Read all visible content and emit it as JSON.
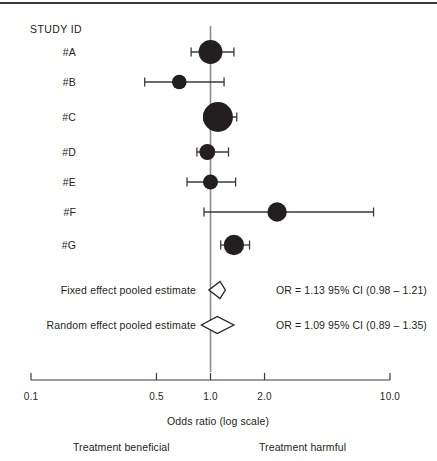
{
  "figure": {
    "type": "forest-plot",
    "header_label": "STUDY ID",
    "axis_title": "Odds ratio (log scale)",
    "footnote_left": "Treatment beneficial",
    "footnote_right": "Treatment harmful",
    "marker_color": "#231f20",
    "line_color": "#3a3a3a",
    "ref_line_color": "#8a8a8a"
  },
  "chart_data": {
    "type": "scatter",
    "title": "",
    "xlabel": "Odds ratio (log scale)",
    "ylabel": "",
    "scale": "log",
    "xlim": [
      0.1,
      10.0
    ],
    "tick_values": [
      0.1,
      0.5,
      1.0,
      2.0,
      10.0
    ],
    "tick_labels": [
      "0.1",
      "0.5",
      "1.0",
      "2.0",
      "10.0"
    ],
    "grid": false,
    "legend": "none",
    "reference_line": 1.0,
    "rows": [
      {
        "label": "#A",
        "or": 1.0,
        "ci_low": 0.78,
        "ci_high": 1.35,
        "weight": 0.72,
        "kind": "study"
      },
      {
        "label": "#B",
        "or": 0.67,
        "ci_low": 0.43,
        "ci_high": 1.19,
        "weight": 0.3,
        "kind": "study"
      },
      {
        "label": "#C",
        "or": 1.1,
        "ci_low": 0.92,
        "ci_high": 1.4,
        "weight": 1.0,
        "kind": "study"
      },
      {
        "label": "#D",
        "or": 0.96,
        "ci_low": 0.84,
        "ci_high": 1.26,
        "weight": 0.36,
        "kind": "study"
      },
      {
        "label": "#E",
        "or": 1.0,
        "ci_low": 0.74,
        "ci_high": 1.38,
        "weight": 0.32,
        "kind": "study"
      },
      {
        "label": "#F",
        "or": 2.35,
        "ci_low": 0.92,
        "ci_high": 8.1,
        "weight": 0.52,
        "kind": "study"
      },
      {
        "label": "#G",
        "or": 1.35,
        "ci_low": 1.14,
        "ci_high": 1.65,
        "weight": 0.56,
        "kind": "study"
      }
    ],
    "pooled": [
      {
        "label": "Fixed effect pooled estimate",
        "or": 1.13,
        "ci_low": 0.98,
        "ci_high": 1.21,
        "kind": "diamond",
        "annotation": "OR = 1.13 95% CI (0.98 – 1.21)"
      },
      {
        "label": "Random effect pooled estimate",
        "or": 1.09,
        "ci_low": 0.89,
        "ci_high": 1.35,
        "kind": "diamond",
        "annotation": "OR = 1.09 95% CI (0.89 – 1.35)"
      }
    ]
  }
}
